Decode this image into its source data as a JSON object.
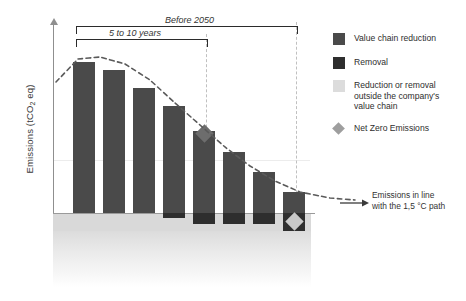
{
  "axis": {
    "y_label": "Emissions (tCO2 eq)",
    "y_label_prefix": "Emissions (tCO",
    "y_label_sub": "2",
    "y_label_suffix": " eq)"
  },
  "annotations": {
    "bracket_outer": "Before 2050",
    "bracket_inner": "5 to 10 years",
    "path_line1": "Emissions in line",
    "path_line2": "with the 1,5 °C path"
  },
  "legend": [
    {
      "label": "Value chain reduction",
      "swatch": "square",
      "color": "#4a4a4a"
    },
    {
      "label": "Removal",
      "swatch": "square",
      "color": "#2e2e2e"
    },
    {
      "label": "Reduction or removal outside the company's value chain",
      "swatch": "square",
      "color": "#dcdcdc"
    },
    {
      "label": "Net Zero Emissions",
      "swatch": "diamond",
      "color": "#9e9e9e"
    }
  ],
  "chart_data": {
    "type": "bar",
    "title": "",
    "xlabel": "",
    "ylabel": "Emissions (tCO2 eq)",
    "grid": false,
    "legend_position": "right",
    "categories": [
      "1",
      "2",
      "3",
      "4",
      "5",
      "6",
      "7",
      "8"
    ],
    "series": [
      {
        "name": "Value chain reduction",
        "color": "#4a4a4a",
        "values": [
          151,
          143,
          125,
          107,
          82,
          61,
          41,
          21
        ]
      },
      {
        "name": "Removal",
        "color": "#2e2e2e",
        "values": [
          0,
          0,
          0,
          5,
          11,
          11,
          11,
          18
        ]
      }
    ],
    "markers": [
      {
        "name": "Net Zero Emissions",
        "category": "5",
        "style": "diamond-dark"
      },
      {
        "name": "Net Zero Emissions",
        "category": "8",
        "style": "diamond-light"
      }
    ],
    "trend": {
      "name": "Emissions in line with the 1,5 °C path",
      "style": "dashed",
      "x": [
        56,
        78,
        100,
        125,
        150,
        175,
        200,
        225,
        250,
        275,
        300,
        330,
        355
      ],
      "y": [
        82,
        59,
        57,
        64,
        80,
        103,
        125,
        147,
        166,
        181,
        192,
        198,
        200
      ]
    }
  }
}
